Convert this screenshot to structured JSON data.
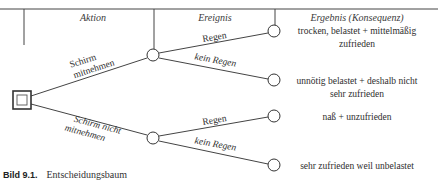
{
  "columns": {
    "action": "Aktion",
    "event": "Ereignis",
    "result": "Ergebnis (Konsequenz)"
  },
  "decision_node": {
    "type": "decision",
    "shape": "double-square"
  },
  "actions": [
    {
      "label_line1": "Schirm",
      "label_line2": "mitnehmen"
    },
    {
      "label_line1": "Schirm nicht",
      "label_line2": "mitnehmen"
    }
  ],
  "events": [
    {
      "label": "Regen"
    },
    {
      "label": "kein Regen"
    },
    {
      "label": "Regen"
    },
    {
      "label": "kein Regen"
    }
  ],
  "results": [
    {
      "line1": "trocken, belastet + mittelmäßig",
      "line2": "zufrieden"
    },
    {
      "line1": "unnötig belastet + deshalb nicht",
      "line2": "sehr zufrieden"
    },
    {
      "line1": "naß + unzufrieden",
      "line2": ""
    },
    {
      "line1": "sehr zufrieden weil unbelastet",
      "line2": ""
    }
  ],
  "caption": {
    "number": "Bild 9.1.",
    "text": "Entscheidungsbaum"
  }
}
